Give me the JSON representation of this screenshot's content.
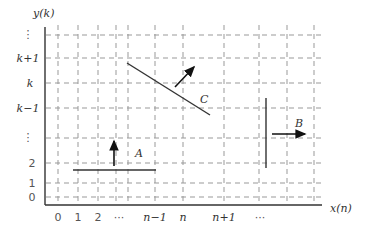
{
  "axes": {
    "y_label": "y(k)",
    "x_label": "x(n)",
    "y_ticks": [
      "⋮",
      "k+1",
      "k",
      "k−1",
      "⋮",
      "2",
      "1",
      "0"
    ],
    "x_ticks": [
      "0",
      "1",
      "2",
      "···",
      "n−1",
      "n",
      "n+1",
      "···"
    ]
  },
  "segments": {
    "A": {
      "label": "A",
      "orientation": "horizontal",
      "arrow": "up"
    },
    "B": {
      "label": "B",
      "orientation": "vertical",
      "arrow": "right"
    },
    "C": {
      "label": "C",
      "orientation": "diagonal",
      "arrow": "up-right"
    }
  },
  "colors": {
    "line": "#333333",
    "grid": "#999999"
  }
}
